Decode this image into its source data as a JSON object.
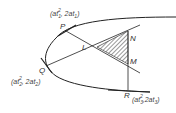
{
  "diagram": {
    "points": {
      "P": {
        "label": "P",
        "coord_text": "(at₁², 2at₁)",
        "base": "(at",
        "sup": "2",
        "sub": "1",
        "mid": ", 2at",
        "sub2": "1",
        "end": ")"
      },
      "Q": {
        "label": "Q",
        "base": "(at",
        "sup": "2",
        "sub": "2",
        "mid": ", 2at",
        "sub2": "2",
        "end": ")"
      },
      "R": {
        "label": "R",
        "base": "(at",
        "sup": "2",
        "sub": "3",
        "mid": ",2at",
        "sub2": "3",
        "end": ")"
      },
      "L": {
        "label": "L"
      },
      "M": {
        "label": "M"
      },
      "N": {
        "label": "N"
      }
    }
  }
}
